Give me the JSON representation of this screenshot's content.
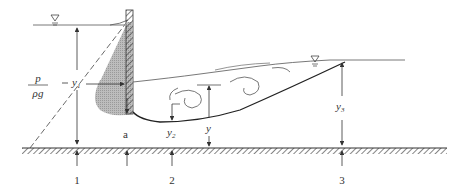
{
  "diagram": {
    "title": "",
    "type": "sluice gate with hydraulic jump",
    "labels": {
      "pressure_num": "p",
      "pressure_den": "ρg",
      "y1": "y",
      "y1_sub": "1",
      "y2": "y",
      "y2_sub": "2",
      "y": "y",
      "y3": "y",
      "y3_sub": "3",
      "gate_opening": "a",
      "section1": "1",
      "section2": "2",
      "section3": "3"
    },
    "symbols": {
      "upstream_water_surface": "water-surface-triangle",
      "downstream_water_surface": "water-surface-triangle"
    },
    "colors": {
      "line": "#333333",
      "pressure_fill": "#b8b8b8",
      "background": "#ffffff"
    }
  }
}
